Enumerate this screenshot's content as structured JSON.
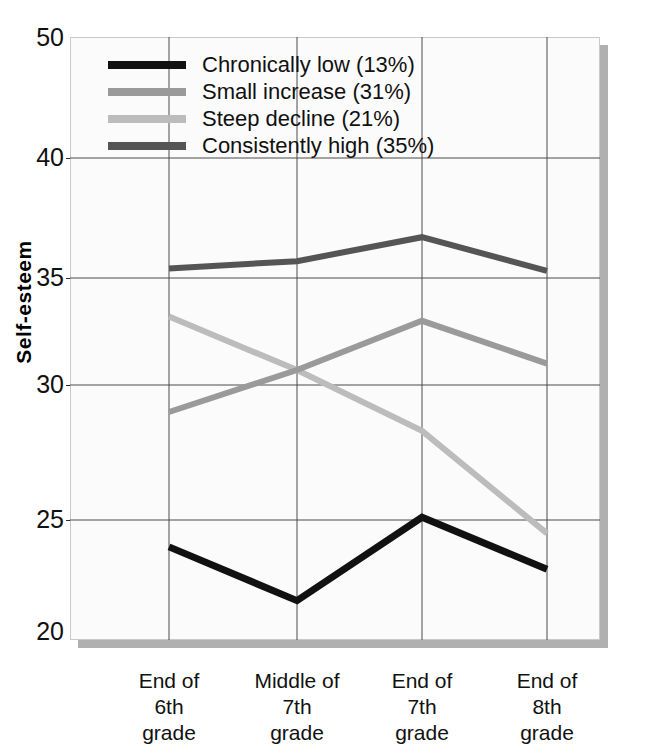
{
  "chart_data": {
    "type": "line",
    "title": "",
    "xlabel": "",
    "ylabel": "Self-esteem",
    "ylim": [
      20,
      50
    ],
    "yticks": [
      20,
      25,
      30,
      35,
      40,
      50
    ],
    "ytick_labels": [
      "20",
      "25",
      "30",
      "35",
      "40",
      "50"
    ],
    "grid": true,
    "legend_position": "top-left",
    "categories": [
      "End of 6th grade",
      "Middle of 7th grade",
      "End of 7th grade",
      "End of 8th grade"
    ],
    "category_lines": [
      [
        "End of",
        "6th",
        "grade"
      ],
      [
        "Middle of",
        "7th",
        "grade"
      ],
      [
        "End of",
        "7th",
        "grade"
      ],
      [
        "End of",
        "8th",
        "grade"
      ]
    ],
    "series": [
      {
        "name": "Chronically low (13%)",
        "short_name": "Chronically low",
        "percent": "13%",
        "color": "#111111",
        "values": [
          23.8,
          21.4,
          25.1,
          22.8
        ]
      },
      {
        "name": "Small increase (31%)",
        "short_name": "Small increase",
        "percent": "31%",
        "color": "#9a9a9a",
        "values": [
          29.0,
          30.7,
          33.0,
          31.0
        ]
      },
      {
        "name": "Steep decline (21%)",
        "short_name": "Steep decline",
        "percent": "21%",
        "color": "#bcbcbc",
        "values": [
          33.2,
          30.7,
          28.3,
          24.4
        ]
      },
      {
        "name": "Consistently high (35%)",
        "short_name": "Consistently high",
        "percent": "35%",
        "color": "#555555",
        "values": [
          35.4,
          35.7,
          36.7,
          35.3
        ]
      }
    ]
  },
  "axis": {
    "y_title": "Self-esteem",
    "y_tick_labels": [
      "50",
      "40",
      "35",
      "30",
      "25",
      "20"
    ]
  },
  "legend": {
    "entries": [
      {
        "label": "Chronically low (13%)",
        "color": "#111111"
      },
      {
        "label": "Small increase (31%)",
        "color": "#9a9a9a"
      },
      {
        "label": "Steep decline (21%)",
        "color": "#bcbcbc"
      },
      {
        "label": "Consistently high (35%)",
        "color": "#555555"
      }
    ]
  },
  "colors": {
    "plot_background": "#fbfbfb",
    "frame_border": "#c9c9c9",
    "gridline": "#4a4a4a",
    "shadow": "#b0b0b0"
  }
}
